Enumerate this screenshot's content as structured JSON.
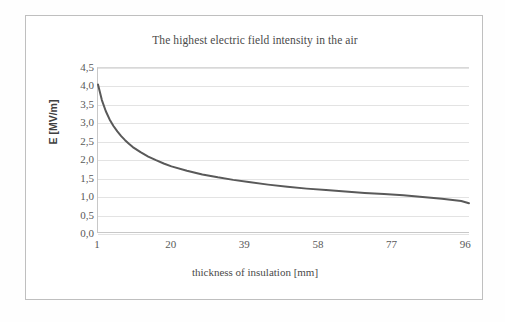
{
  "chart_data": {
    "type": "line",
    "title": "The highest electric field intensity in the air",
    "xlabel": "thickness of insulation [mm]",
    "ylabel": "E [MV/m]",
    "xlim": [
      1,
      97
    ],
    "ylim": [
      0,
      4.5
    ],
    "grid": "horizontal",
    "legend": "none",
    "decimal_separator": ",",
    "line_color": "#595959",
    "gridline_color": "#e3e3e3",
    "x_ticks": [
      "1",
      "20",
      "39",
      "58",
      "77",
      "96"
    ],
    "x_tick_values": [
      1,
      20,
      39,
      58,
      77,
      96
    ],
    "y_ticks": [
      "0,0",
      "0,5",
      "1,0",
      "1,5",
      "2,0",
      "2,5",
      "3,0",
      "3,5",
      "4,0",
      "4,5"
    ],
    "y_tick_values": [
      0.0,
      0.5,
      1.0,
      1.5,
      2.0,
      2.5,
      3.0,
      3.5,
      4.0,
      4.5
    ],
    "series": [
      {
        "name": "E",
        "x": [
          1,
          2,
          3,
          4,
          5,
          6,
          7,
          8,
          9,
          10,
          12,
          14,
          16,
          18,
          20,
          24,
          28,
          32,
          36,
          40,
          45,
          50,
          55,
          60,
          65,
          70,
          75,
          80,
          85,
          90,
          95,
          97
        ],
        "values": [
          4.05,
          3.62,
          3.32,
          3.09,
          2.91,
          2.76,
          2.63,
          2.52,
          2.42,
          2.33,
          2.19,
          2.07,
          1.97,
          1.88,
          1.8,
          1.68,
          1.58,
          1.5,
          1.43,
          1.37,
          1.3,
          1.24,
          1.19,
          1.15,
          1.11,
          1.07,
          1.04,
          1.01,
          0.96,
          0.91,
          0.85,
          0.79
        ]
      }
    ]
  }
}
